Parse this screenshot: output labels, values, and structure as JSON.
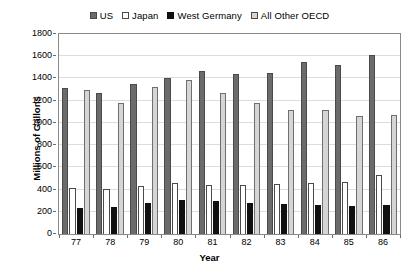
{
  "chart_data": {
    "type": "bar",
    "title": "",
    "xlabel": "Year",
    "ylabel": "Millions of Gallons",
    "ylim": [
      0,
      1800
    ],
    "ytick_step": 200,
    "yticks": [
      "1800",
      "1600",
      "1400",
      "1200",
      "1000",
      "800",
      "600",
      "400",
      "200",
      "0"
    ],
    "grid": true,
    "legend_position": "top-center",
    "categories": [
      "77",
      "78",
      "79",
      "80",
      "81",
      "82",
      "83",
      "84",
      "85",
      "86"
    ],
    "series": [
      {
        "name": "US",
        "color": "#6b6b6b",
        "values": [
          1310,
          1270,
          1350,
          1400,
          1470,
          1440,
          1450,
          1550,
          1520,
          1610
        ]
      },
      {
        "name": "Japan",
        "color": "#ffffff",
        "values": [
          410,
          405,
          430,
          455,
          440,
          445,
          450,
          460,
          470,
          530
        ]
      },
      {
        "name": "West Germany",
        "color": "#101010",
        "values": [
          230,
          245,
          275,
          310,
          300,
          280,
          270,
          265,
          250,
          260
        ]
      },
      {
        "name": "All Other OECD",
        "color": "#d5d5d5",
        "values": [
          1300,
          1180,
          1320,
          1390,
          1270,
          1180,
          1120,
          1120,
          1060,
          1070
        ]
      }
    ]
  },
  "legend": {
    "items": [
      {
        "label": "US",
        "swatch": "legend-swatch-us"
      },
      {
        "label": "Japan",
        "swatch": "legend-swatch-japan"
      },
      {
        "label": "West Germany",
        "swatch": "legend-swatch-west-germany"
      },
      {
        "label": "All Other OECD",
        "swatch": "legend-swatch-all-other-oecd"
      }
    ]
  }
}
